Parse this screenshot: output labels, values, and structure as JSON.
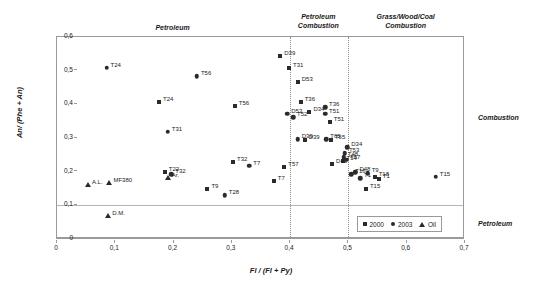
{
  "chart_data": {
    "type": "scatter",
    "title": "",
    "xlabel": "Fl / (Fl + Py)",
    "ylabel": "An/ (Phe + An)",
    "xlim": [
      0,
      0.7
    ],
    "ylim": [
      0,
      0.6
    ],
    "grid": false,
    "xticks": [
      "0",
      "0,1",
      "0,2",
      "0,3",
      "0,4",
      "0,5",
      "0,6",
      "0,7"
    ],
    "xtick_values": [
      0,
      0.1,
      0.2,
      0.3,
      0.4,
      0.5,
      0.6,
      0.7
    ],
    "yticks": [
      "0",
      "0,1",
      "0,2",
      "0,3",
      "0,4",
      "0,5",
      "0,6"
    ],
    "ytick_values": [
      0,
      0.1,
      0.2,
      0.3,
      0.4,
      0.5,
      0.6
    ],
    "legend_position": "bottom-right",
    "legend": [
      {
        "label": "2000",
        "marker": "square"
      },
      {
        "label": "2003",
        "marker": "circle"
      },
      {
        "label": "Oil",
        "marker": "triangle"
      }
    ],
    "dividers": {
      "vertical": [
        0.4,
        0.5
      ],
      "horizontal": [
        0.1
      ]
    },
    "zone_labels": [
      {
        "text": "Petroleum",
        "x": 0.2,
        "y": 0.625
      },
      {
        "text": "Petroleum\nCombustion",
        "x": 0.45,
        "y": 0.655
      },
      {
        "text": "Grass/Wood/Coal\nCombustion",
        "x": 0.6,
        "y": 0.655
      }
    ],
    "side_labels": [
      {
        "text": "Combustion",
        "position": "right-upper"
      },
      {
        "text": "Petroleum",
        "position": "right-lower"
      }
    ],
    "series": [
      {
        "name": "2000",
        "marker": "square",
        "points": [
          {
            "label": "T24",
            "x": 0.175,
            "y": 0.408
          },
          {
            "label": "T56",
            "x": 0.305,
            "y": 0.396
          },
          {
            "label": "D39",
            "x": 0.383,
            "y": 0.543
          },
          {
            "label": "T31",
            "x": 0.398,
            "y": 0.508
          },
          {
            "label": "D53",
            "x": 0.413,
            "y": 0.465
          },
          {
            "label": "T36",
            "x": 0.418,
            "y": 0.408
          },
          {
            "label": "D34",
            "x": 0.433,
            "y": 0.378
          },
          {
            "label": "T51",
            "x": 0.468,
            "y": 0.348
          },
          {
            "label": "T65",
            "x": 0.47,
            "y": 0.295
          },
          {
            "label": "D39",
            "x": 0.425,
            "y": 0.295
          },
          {
            "label": "T54",
            "x": 0.49,
            "y": 0.232
          },
          {
            "label": "D43",
            "x": 0.472,
            "y": 0.222
          },
          {
            "label": "T32",
            "x": 0.302,
            "y": 0.229
          },
          {
            "label": "T57",
            "x": 0.39,
            "y": 0.214
          },
          {
            "label": "T7",
            "x": 0.372,
            "y": 0.173
          },
          {
            "label": "T22",
            "x": 0.185,
            "y": 0.198
          },
          {
            "label": "T9",
            "x": 0.258,
            "y": 0.148
          },
          {
            "label": "T18",
            "x": 0.545,
            "y": 0.185
          },
          {
            "label": "T15",
            "x": 0.53,
            "y": 0.148
          },
          {
            "label": "T1",
            "x": 0.552,
            "y": 0.178
          }
        ]
      },
      {
        "name": "2003",
        "marker": "circle",
        "points": [
          {
            "label": "T24",
            "x": 0.085,
            "y": 0.508
          },
          {
            "label": "T56",
            "x": 0.24,
            "y": 0.484
          },
          {
            "label": "T31",
            "x": 0.19,
            "y": 0.318
          },
          {
            "label": "D53",
            "x": 0.395,
            "y": 0.372
          },
          {
            "label": "T52",
            "x": 0.405,
            "y": 0.362
          },
          {
            "label": "T36",
            "x": 0.46,
            "y": 0.392
          },
          {
            "label": "T51",
            "x": 0.46,
            "y": 0.372
          },
          {
            "label": "T65",
            "x": 0.462,
            "y": 0.296
          },
          {
            "label": "D39",
            "x": 0.413,
            "y": 0.296
          },
          {
            "label": "D34",
            "x": 0.498,
            "y": 0.272
          },
          {
            "label": "T53",
            "x": 0.494,
            "y": 0.255
          },
          {
            "label": "T48",
            "x": 0.492,
            "y": 0.243
          },
          {
            "label": "T57",
            "x": 0.496,
            "y": 0.235
          },
          {
            "label": "D48",
            "x": 0.512,
            "y": 0.198
          },
          {
            "label": "T1",
            "x": 0.52,
            "y": 0.18
          },
          {
            "label": "T16",
            "x": 0.505,
            "y": 0.192
          },
          {
            "label": "T9",
            "x": 0.533,
            "y": 0.196
          },
          {
            "label": "T7",
            "x": 0.33,
            "y": 0.218
          },
          {
            "label": "T28",
            "x": 0.288,
            "y": 0.13
          },
          {
            "label": "T32",
            "x": 0.196,
            "y": 0.192
          },
          {
            "label": "T15",
            "x": 0.65,
            "y": 0.185
          }
        ]
      },
      {
        "name": "Oil",
        "marker": "triangle",
        "points": [
          {
            "label": "A.L.",
            "x": 0.053,
            "y": 0.16
          },
          {
            "label": "MF380",
            "x": 0.09,
            "y": 0.167
          },
          {
            "label": "Ar.",
            "x": 0.19,
            "y": 0.182
          },
          {
            "label": "D.M.",
            "x": 0.088,
            "y": 0.068
          }
        ]
      }
    ]
  }
}
